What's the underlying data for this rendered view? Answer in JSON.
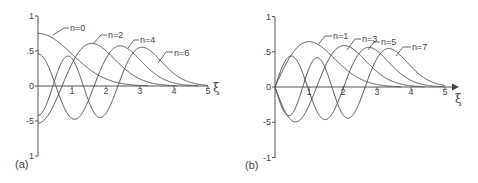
{
  "chart_data": [
    {
      "type": "line",
      "panel_label": "(a)",
      "title": "Harmonic oscillator eigenfunctions, even n",
      "xlabel": "ξ",
      "ylabel": "",
      "xlim": [
        0,
        5
      ],
      "ylim": [
        -1,
        1
      ],
      "x_ticks": [
        "1",
        "2",
        "3",
        "4",
        "5"
      ],
      "y_ticks": [
        {
          "value": 1,
          "label": "1"
        },
        {
          "value": 0.5,
          "label": ".5"
        },
        {
          "value": 0,
          "label": "0"
        },
        {
          "value": -0.5,
          "label": "-5"
        },
        {
          "value": -1,
          "label": "1"
        }
      ],
      "grid": false,
      "arrow": false,
      "series": [
        {
          "name": "n=0",
          "n": 0,
          "value_at_0": 0.75,
          "peak": [
            0,
            0.75
          ],
          "label_pos": [
            70,
            31
          ],
          "leader": [
            [
              53,
              35
            ],
            [
              64,
              28
            ],
            [
              69,
              28
            ]
          ]
        },
        {
          "name": "n=2",
          "n": 2,
          "value_at_0": -0.53,
          "peak": [
            1.5,
            0.59
          ],
          "label_pos": [
            108,
            38
          ],
          "leader": [
            [
              93,
              44
            ],
            [
              101,
              35
            ],
            [
              107,
              35
            ]
          ]
        },
        {
          "name": "n=4",
          "n": 4,
          "value_at_0": 0.46,
          "peak": [
            2.3,
            0.55
          ],
          "label_pos": [
            140,
            43
          ],
          "leader": [
            [
              128,
              48
            ],
            [
              134,
              40
            ],
            [
              139,
              40
            ]
          ]
        },
        {
          "name": "n=6",
          "n": 6,
          "value_at_0": -0.42,
          "peak": [
            3.0,
            0.53
          ],
          "label_pos": [
            174,
            56
          ],
          "leader": [
            [
              158,
              63
            ],
            [
              166,
              52
            ],
            [
              173,
              52
            ]
          ]
        }
      ]
    },
    {
      "type": "line",
      "panel_label": "(b)",
      "title": "Harmonic oscillator eigenfunctions, odd n",
      "xlabel": "ξ",
      "ylabel": "",
      "xlim": [
        0,
        5
      ],
      "ylim": [
        -1,
        1
      ],
      "x_ticks": [
        "1",
        "2",
        "3",
        "4",
        "5"
      ],
      "y_ticks": [
        {
          "value": 1,
          "label": "1"
        },
        {
          "value": 0.5,
          "label": ".5"
        },
        {
          "value": 0,
          "label": "0"
        },
        {
          "value": -0.5,
          "label": "-5"
        },
        {
          "value": -1,
          "label": "-1"
        }
      ],
      "grid": false,
      "arrow": true,
      "series": [
        {
          "name": "n=1",
          "n": 1,
          "value_at_0": 0,
          "peak": [
            1.0,
            0.64
          ],
          "label_pos": [
            333,
            39
          ],
          "leader": [
            [
              318,
              45
            ],
            [
              325,
              36
            ],
            [
              332,
              36
            ]
          ]
        },
        {
          "name": "n=3",
          "n": 3,
          "value_at_0": 0,
          "peak": [
            1.8,
            0.57
          ],
          "label_pos": [
            362,
            42
          ],
          "leader": [
            [
              347,
              50
            ],
            [
              355,
              39
            ],
            [
              361,
              39
            ]
          ]
        },
        {
          "name": "n=5",
          "n": 5,
          "value_at_0": 0,
          "peak": [
            2.6,
            0.54
          ],
          "label_pos": [
            381,
            45
          ],
          "leader": [
            [
              368,
              50
            ],
            [
              374,
              42
            ],
            [
              380,
              42
            ]
          ]
        },
        {
          "name": "n=7",
          "n": 7,
          "value_at_0": 0,
          "peak": [
            3.3,
            0.53
          ],
          "label_pos": [
            412,
            50
          ],
          "leader": [
            [
              396,
              56
            ],
            [
              403,
              47
            ],
            [
              411,
              47
            ]
          ]
        }
      ]
    }
  ],
  "layout": {
    "panels": [
      {
        "origin": [
          38,
          86
        ],
        "x_scale": 34,
        "y_scale": 70,
        "y_top": 16,
        "y_bottom": 156,
        "x_end": 208,
        "xlab_pos": [
          213,
          92
        ],
        "panel_label_pos": [
          15,
          168
        ]
      },
      {
        "origin": [
          275,
          87
        ],
        "x_scale": 34,
        "y_scale": 70.5,
        "y_top": 17,
        "y_bottom": 158,
        "x_end": 452,
        "xlab_pos": [
          455,
          103
        ],
        "panel_label_pos": [
          245,
          169
        ]
      }
    ]
  }
}
